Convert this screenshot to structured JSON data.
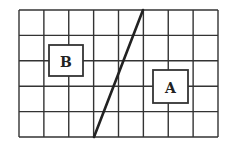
{
  "grid": {
    "columns": 8,
    "rows": 5,
    "left": 19,
    "top": 10,
    "right": 218,
    "bottom": 137,
    "line_color": "#333333"
  },
  "diagonal_line": {
    "x1": 94,
    "y1": 137,
    "x2": 143,
    "y2": 10,
    "color": "#222222"
  },
  "boxes": [
    {
      "label": "B",
      "x": 49,
      "y": 45,
      "width": 34,
      "height": 31
    },
    {
      "label": "A",
      "x": 153,
      "y": 70,
      "width": 35,
      "height": 33
    }
  ]
}
